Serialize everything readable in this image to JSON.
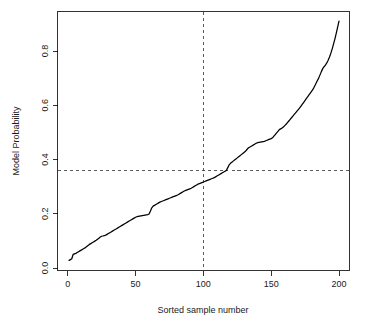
{
  "chart_data": {
    "type": "line",
    "title": "",
    "xlabel": "Sorted sample number",
    "ylabel": "Model Probability",
    "xlim": [
      -3,
      206
    ],
    "ylim": [
      0.0,
      0.93
    ],
    "grid": false,
    "legend": null,
    "xticks": [
      0,
      50,
      100,
      150,
      200
    ],
    "xtick_labels": [
      "0",
      "50",
      "100",
      "150",
      "200"
    ],
    "yticks": [
      0.0,
      0.2,
      0.4,
      0.6,
      0.8
    ],
    "ytick_labels": [
      "0.0",
      "0.2",
      "0.4",
      "0.6",
      "0.8"
    ],
    "annotations": [
      {
        "name": "vertical-reference-line",
        "orientation": "vertical",
        "value": 100,
        "style": "dashed"
      },
      {
        "name": "horizontal-reference-line",
        "orientation": "horizontal",
        "value": 0.36,
        "style": "dashed"
      }
    ],
    "series": [
      {
        "name": "Sorted model probability",
        "color": "#000000",
        "x": [
          1,
          2,
          3,
          4,
          5,
          6,
          7,
          8,
          9,
          10,
          11,
          12,
          13,
          14,
          15,
          16,
          17,
          18,
          19,
          20,
          21,
          22,
          23,
          24,
          25,
          26,
          27,
          28,
          29,
          30,
          31,
          32,
          33,
          34,
          35,
          36,
          37,
          38,
          39,
          40,
          41,
          42,
          43,
          44,
          45,
          46,
          47,
          48,
          49,
          50,
          51,
          52,
          53,
          54,
          55,
          56,
          57,
          58,
          59,
          60,
          61,
          62,
          63,
          64,
          65,
          66,
          67,
          68,
          69,
          70,
          71,
          72,
          73,
          74,
          75,
          76,
          77,
          78,
          79,
          80,
          81,
          82,
          83,
          84,
          85,
          86,
          87,
          88,
          89,
          90,
          91,
          92,
          93,
          94,
          95,
          96,
          97,
          98,
          99,
          100,
          101,
          102,
          103,
          104,
          105,
          106,
          107,
          108,
          109,
          110,
          111,
          112,
          113,
          114,
          115,
          116,
          117,
          118,
          119,
          120,
          121,
          122,
          123,
          124,
          125,
          126,
          127,
          128,
          129,
          130,
          131,
          132,
          133,
          134,
          135,
          136,
          137,
          138,
          139,
          140,
          141,
          142,
          143,
          144,
          145,
          146,
          147,
          148,
          149,
          150,
          151,
          152,
          153,
          154,
          155,
          156,
          157,
          158,
          159,
          160,
          161,
          162,
          163,
          164,
          165,
          166,
          167,
          168,
          169,
          170,
          171,
          172,
          173,
          174,
          175,
          176,
          177,
          178,
          179,
          180,
          181,
          182,
          183,
          184,
          185,
          186,
          187,
          188,
          189,
          190,
          191,
          192,
          193,
          194,
          195,
          196,
          197,
          198,
          199,
          200
        ],
        "y": [
          0.028,
          0.031,
          0.034,
          0.05,
          0.052,
          0.054,
          0.057,
          0.06,
          0.063,
          0.066,
          0.069,
          0.072,
          0.075,
          0.079,
          0.083,
          0.087,
          0.09,
          0.093,
          0.096,
          0.099,
          0.102,
          0.106,
          0.11,
          0.114,
          0.117,
          0.118,
          0.119,
          0.121,
          0.124,
          0.127,
          0.13,
          0.133,
          0.136,
          0.139,
          0.142,
          0.145,
          0.148,
          0.151,
          0.154,
          0.157,
          0.16,
          0.163,
          0.166,
          0.169,
          0.172,
          0.175,
          0.178,
          0.181,
          0.184,
          0.187,
          0.189,
          0.19,
          0.191,
          0.192,
          0.193,
          0.194,
          0.195,
          0.196,
          0.197,
          0.199,
          0.21,
          0.222,
          0.228,
          0.231,
          0.234,
          0.237,
          0.24,
          0.243,
          0.245,
          0.247,
          0.249,
          0.251,
          0.253,
          0.255,
          0.257,
          0.259,
          0.261,
          0.263,
          0.265,
          0.267,
          0.269,
          0.272,
          0.275,
          0.278,
          0.281,
          0.284,
          0.286,
          0.288,
          0.29,
          0.292,
          0.294,
          0.297,
          0.3,
          0.303,
          0.306,
          0.309,
          0.311,
          0.313,
          0.315,
          0.317,
          0.319,
          0.321,
          0.323,
          0.325,
          0.327,
          0.329,
          0.331,
          0.333,
          0.336,
          0.339,
          0.342,
          0.345,
          0.348,
          0.351,
          0.354,
          0.357,
          0.36,
          0.37,
          0.38,
          0.386,
          0.39,
          0.394,
          0.398,
          0.402,
          0.406,
          0.41,
          0.414,
          0.418,
          0.422,
          0.426,
          0.43,
          0.436,
          0.442,
          0.445,
          0.448,
          0.451,
          0.454,
          0.457,
          0.46,
          0.462,
          0.463,
          0.464,
          0.465,
          0.466,
          0.467,
          0.469,
          0.471,
          0.473,
          0.475,
          0.477,
          0.48,
          0.486,
          0.492,
          0.498,
          0.504,
          0.51,
          0.513,
          0.516,
          0.52,
          0.525,
          0.53,
          0.536,
          0.542,
          0.548,
          0.554,
          0.56,
          0.566,
          0.572,
          0.578,
          0.584,
          0.59,
          0.597,
          0.604,
          0.611,
          0.618,
          0.625,
          0.632,
          0.639,
          0.646,
          0.653,
          0.66,
          0.67,
          0.68,
          0.69,
          0.7,
          0.712,
          0.724,
          0.735,
          0.742,
          0.748,
          0.756,
          0.766,
          0.778,
          0.792,
          0.808,
          0.826,
          0.845,
          0.866,
          0.888,
          0.91
        ]
      }
    ]
  }
}
